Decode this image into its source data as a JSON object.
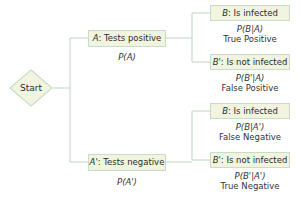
{
  "start": {
    "label": "Start"
  },
  "level1": [
    {
      "event": "A",
      "description": ": Tests positive",
      "probability": "P(A)"
    },
    {
      "event": "A'",
      "description": ": Tests negative",
      "probability": "P(A')"
    }
  ],
  "level2": [
    {
      "event": "B",
      "description": ": Is infected",
      "probability": "P(B|A)",
      "outcome": "True Positive"
    },
    {
      "event": "B'",
      "description": ": Is not infected",
      "probability": "P(B'|A)",
      "outcome": "False Positive"
    },
    {
      "event": "B",
      "description": ": Is infected",
      "probability": "P(B|A')",
      "outcome": "False Negative"
    },
    {
      "event": "B'",
      "description": ": Is not infected",
      "probability": "P(B'|A')",
      "outcome": "True Negative"
    }
  ],
  "colors": {
    "node_fill": "#f1f5e0",
    "node_border": "#c9dcc8",
    "line": "#c9dcc8"
  }
}
